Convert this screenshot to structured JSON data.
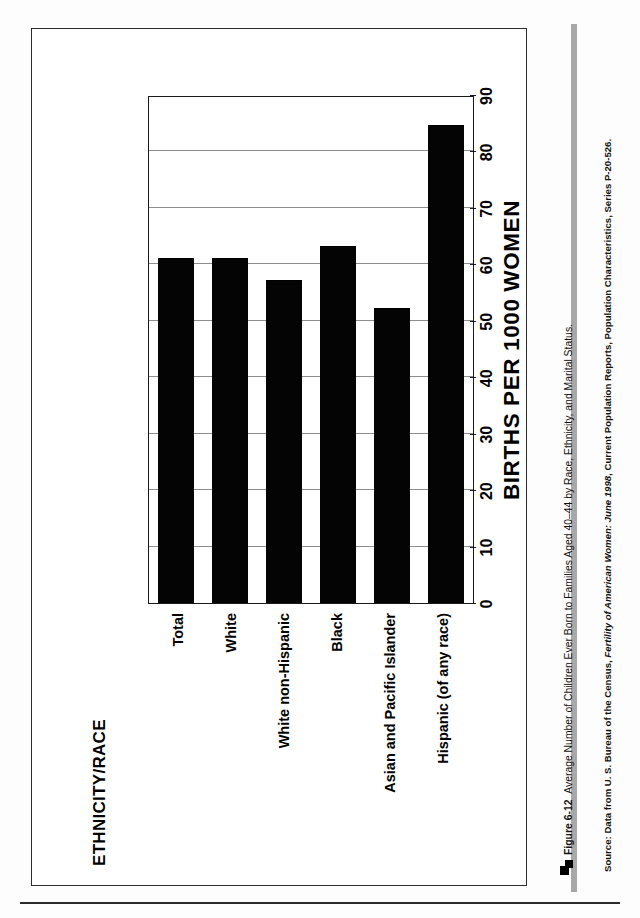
{
  "figure": {
    "number": "Figure 6-12",
    "caption": "Average Number of Children Ever Born to Families Aged 40–44 by Race, Ethnicity, and Marital Status.",
    "source_prefix": "Source: Data from U. S. Bureau of the Census, ",
    "source_italic": "Fertility of American Women: June 1998",
    "source_suffix": ", Current Population Reports, Population Characteristics, Series P-20-526."
  },
  "colors": {
    "bar": "#040404",
    "gridline": "#8c8c8c",
    "frame": "#2b2b2b",
    "spine": "#a8a8a8"
  },
  "chart_data": {
    "type": "bar",
    "orientation": "horizontal",
    "title": "",
    "xlabel": "BIRTHS PER 1000 WOMEN",
    "ylabel": "ETHNICITY/RACE",
    "categories": [
      "Total",
      "White",
      "White non-Hispanic",
      "Black",
      "Asian and Pacific Islander",
      "Hispanic (of any race)"
    ],
    "values": [
      61,
      61,
      57,
      63,
      52,
      84.5
    ],
    "xlim": [
      0,
      90
    ],
    "xticks": [
      0,
      10,
      20,
      30,
      40,
      50,
      60,
      70,
      80,
      90
    ],
    "xtick_labels": [
      "0",
      "10",
      "20",
      "30",
      "40",
      "50",
      "60",
      "70",
      "80",
      "90"
    ],
    "grid": true,
    "grid_axis": "x",
    "legend": null
  }
}
